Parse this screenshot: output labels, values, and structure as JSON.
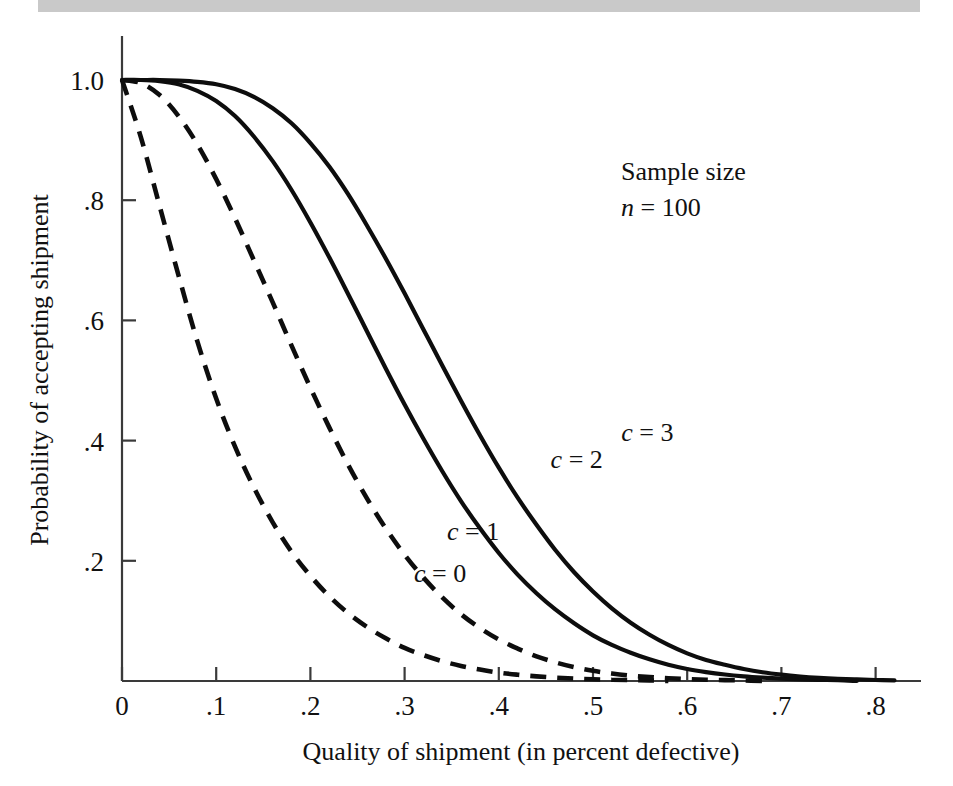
{
  "page": {
    "background_color": "#ffffff",
    "band_color": "#c9c9c9"
  },
  "chart_data": {
    "type": "line",
    "title": "",
    "xlabel": "Quality of shipment (in percent defective)",
    "ylabel": "Probability of accepting shipment",
    "xlim": [
      0,
      0.82
    ],
    "ylim": [
      0,
      1.0
    ],
    "grid": false,
    "legend_position": "inline-annotations",
    "xticks": [
      0,
      0.1,
      0.2,
      0.3,
      0.4,
      0.5,
      0.6,
      0.7,
      0.8
    ],
    "xtick_labels": [
      "0",
      ".1",
      ".2",
      ".3",
      ".4",
      ".5",
      ".6",
      ".7",
      ".8"
    ],
    "yticks": [
      0.2,
      0.4,
      0.6,
      0.8,
      1.0
    ],
    "ytick_labels": [
      ".2",
      ".4",
      ".6",
      ".8",
      "1.0"
    ],
    "annotations": [
      {
        "name": "sample-size-line1",
        "text": "Sample size"
      },
      {
        "name": "sample-size-line2_prefix",
        "text": "n"
      },
      {
        "name": "sample-size-line2_rest",
        "text": " = 100"
      }
    ],
    "x": [
      0,
      0.02,
      0.04,
      0.06,
      0.08,
      0.1,
      0.12,
      0.14,
      0.16,
      0.18,
      0.2,
      0.22,
      0.24,
      0.26,
      0.28,
      0.3,
      0.32,
      0.34,
      0.36,
      0.38,
      0.4,
      0.42,
      0.44,
      0.46,
      0.48,
      0.5,
      0.52,
      0.54,
      0.56,
      0.58,
      0.6,
      0.62,
      0.64,
      0.66,
      0.68,
      0.7,
      0.72,
      0.74,
      0.76,
      0.78,
      0.8,
      0.82
    ],
    "series": [
      {
        "name": "c = 0",
        "label": "c = 0",
        "style": "dashed",
        "color": "#0d0d0d",
        "label_x": 0.31,
        "label_y": 0.165,
        "values": [
          1.0,
          0.905,
          0.79,
          0.675,
          0.565,
          0.47,
          0.39,
          0.322,
          0.264,
          0.215,
          0.175,
          0.141,
          0.113,
          0.09,
          0.071,
          0.055,
          0.043,
          0.033,
          0.025,
          0.019,
          0.014,
          0.0105,
          0.0077,
          0.0056,
          0.004,
          0.0029,
          0.0021,
          0.0015,
          0.001,
          0.0007,
          0.0005,
          0.0003,
          0.0002,
          0.00015,
          0.0001,
          6e-05,
          4e-05,
          2.5e-05,
          1.5e-05,
          1e-05,
          5e-06,
          2e-06
        ]
      },
      {
        "name": "c = 1",
        "label": "c = 1",
        "style": "dashed",
        "color": "#0d0d0d",
        "label_x": 0.345,
        "label_y": 0.235,
        "values": [
          1.0,
          0.995,
          0.975,
          0.94,
          0.893,
          0.835,
          0.77,
          0.7,
          0.63,
          0.558,
          0.488,
          0.422,
          0.36,
          0.304,
          0.254,
          0.21,
          0.172,
          0.139,
          0.111,
          0.088,
          0.069,
          0.054,
          0.041,
          0.031,
          0.023,
          0.017,
          0.0125,
          0.009,
          0.0065,
          0.0046,
          0.0032,
          0.0022,
          0.0015,
          0.001,
          0.0007,
          0.00045,
          0.0003,
          0.0002,
          0.00012,
          7e-05,
          4e-05,
          2e-05
        ]
      },
      {
        "name": "c = 2",
        "label": "c = 2",
        "style": "solid",
        "color": "#0d0d0d",
        "label_x": 0.455,
        "label_y": 0.355,
        "values": [
          1.0,
          1.0,
          0.998,
          0.993,
          0.982,
          0.965,
          0.94,
          0.906,
          0.865,
          0.817,
          0.763,
          0.705,
          0.644,
          0.582,
          0.52,
          0.46,
          0.403,
          0.349,
          0.299,
          0.254,
          0.213,
          0.177,
          0.146,
          0.119,
          0.096,
          0.076,
          0.06,
          0.047,
          0.036,
          0.027,
          0.02,
          0.0148,
          0.0108,
          0.0078,
          0.0056,
          0.0039,
          0.0027,
          0.0019,
          0.0013,
          0.0008,
          0.0005,
          0.0003
        ]
      },
      {
        "name": "c = 3",
        "label": "c = 3",
        "style": "solid",
        "color": "#0d0d0d",
        "label_x": 0.53,
        "label_y": 0.4,
        "values": [
          1.0,
          1.0,
          1.0,
          0.999,
          0.997,
          0.993,
          0.985,
          0.972,
          0.953,
          0.928,
          0.895,
          0.856,
          0.81,
          0.758,
          0.703,
          0.645,
          0.585,
          0.525,
          0.466,
          0.409,
          0.355,
          0.305,
          0.26,
          0.218,
          0.181,
          0.149,
          0.121,
          0.097,
          0.077,
          0.06,
          0.046,
          0.035,
          0.027,
          0.02,
          0.0145,
          0.0105,
          0.0075,
          0.0053,
          0.0037,
          0.0026,
          0.0017,
          0.0011
        ]
      }
    ]
  }
}
